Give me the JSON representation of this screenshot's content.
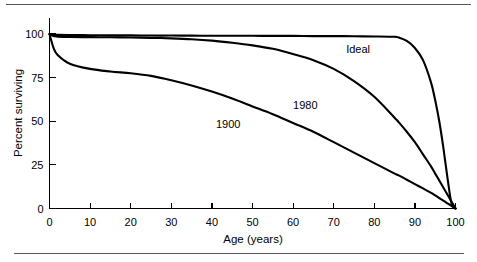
{
  "figure": {
    "name": "survival-curve-figure",
    "top_rule": true,
    "bottom_rule": true,
    "background_color": "#ffffff",
    "line_color": "#000000",
    "rule_color": "#5a5a5a"
  },
  "chart_data": {
    "type": "line",
    "title": "",
    "subtitle": "",
    "xlabel": "Age (years)",
    "ylabel": "Percent surviving",
    "xlim": [
      0,
      100
    ],
    "ylim": [
      0,
      100
    ],
    "xticks": [
      0,
      10,
      20,
      30,
      40,
      50,
      60,
      70,
      80,
      90,
      100
    ],
    "xtick_labels": [
      "0",
      "10",
      "20",
      "30",
      "40",
      "50",
      "60",
      "70",
      "80",
      "90",
      "100"
    ],
    "yticks": [
      0,
      25,
      50,
      75,
      100
    ],
    "ytick_labels": [
      "0",
      "25",
      "50",
      "75",
      "100"
    ],
    "grid": false,
    "legend": "inline-annotations",
    "legend_position": "on-curve",
    "x": [
      0,
      1,
      2,
      5,
      10,
      15,
      20,
      25,
      30,
      35,
      40,
      45,
      50,
      55,
      60,
      65,
      70,
      75,
      80,
      85,
      86,
      88,
      90,
      92,
      94,
      95,
      96,
      97,
      98,
      99,
      100
    ],
    "series": [
      {
        "name": "1900",
        "label": "1900",
        "label_x": 44,
        "label_y": 46,
        "values": [
          100,
          92,
          88,
          83,
          80,
          78.5,
          77.5,
          76,
          73.5,
          70.5,
          67,
          63,
          58.5,
          54,
          49,
          44,
          38,
          32,
          26,
          20,
          19,
          16.5,
          14,
          11.5,
          9,
          7.5,
          6,
          4.5,
          3,
          1.5,
          0
        ]
      },
      {
        "name": "1980",
        "label": "1980",
        "label_x": 63,
        "label_y": 57,
        "values": [
          100,
          98.8,
          98.5,
          98.3,
          98.2,
          98.1,
          98,
          97.8,
          97.5,
          97,
          96.2,
          95,
          93.5,
          91.5,
          88.5,
          85,
          80,
          73,
          64,
          52,
          49.5,
          44,
          38,
          31,
          24,
          20,
          16,
          12,
          8,
          4,
          0
        ]
      },
      {
        "name": "Ideal",
        "label": "Ideal",
        "label_x": 76,
        "label_y": 89,
        "values": [
          100,
          99.6,
          99.5,
          99.4,
          99.3,
          99.2,
          99.2,
          99.1,
          99.1,
          99.05,
          99,
          99,
          99,
          98.9,
          98.9,
          98.8,
          98.8,
          98.7,
          98.6,
          98.4,
          98,
          96,
          92,
          85,
          72,
          62,
          50,
          35,
          18,
          3,
          0
        ]
      }
    ]
  },
  "axes": {
    "x_axis_title": "Age (years)",
    "y_axis_title": "Percent surviving"
  }
}
